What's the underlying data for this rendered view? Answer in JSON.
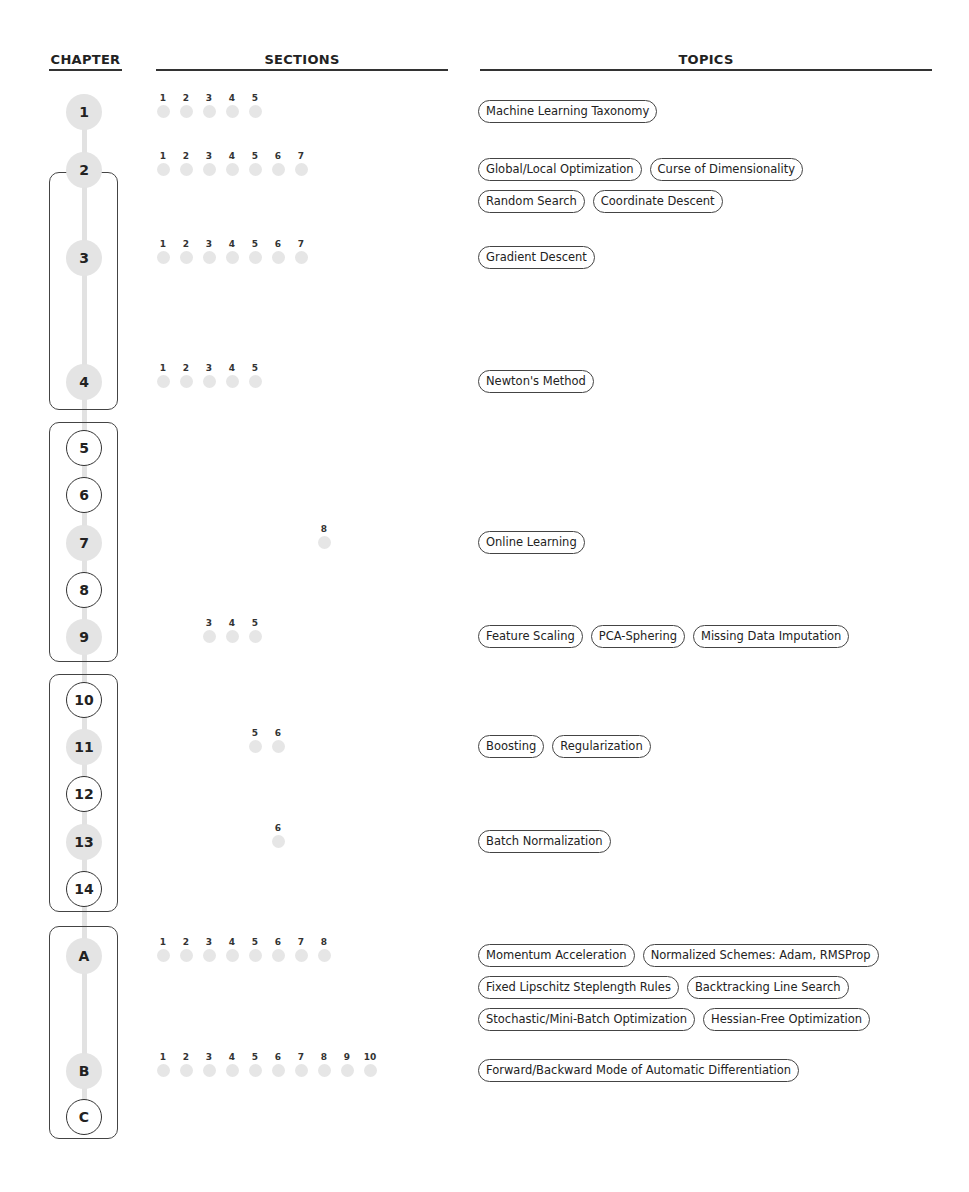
{
  "headers": {
    "chapter": "CHAPTER",
    "sections": "SECTIONS",
    "topics": "TOPICS"
  },
  "colors": {
    "filled_node": "#e4e4e4",
    "section_dot": "#e6e6e6",
    "outline": "#333333",
    "spine": "#e2e2e2"
  },
  "groups": [
    {
      "name": "group-2-4",
      "top": 172,
      "height": 238
    },
    {
      "name": "group-5-9",
      "top": 422,
      "height": 240
    },
    {
      "name": "group-10-14",
      "top": 674,
      "height": 238
    },
    {
      "name": "group-A-C",
      "top": 926,
      "height": 213
    }
  ],
  "chapters": [
    {
      "label": "1",
      "y": 112,
      "style": "filled",
      "sections": [
        1,
        2,
        3,
        4,
        5
      ],
      "topic_rows": [
        [
          "Machine Learning Taxonomy"
        ]
      ]
    },
    {
      "label": "2",
      "y": 170,
      "style": "filled",
      "sections": [
        1,
        2,
        3,
        4,
        5,
        6,
        7
      ],
      "topic_rows": [
        [
          "Global/Local Optimization",
          "Curse of Dimensionality"
        ],
        [
          "Random Search",
          "Coordinate Descent"
        ]
      ]
    },
    {
      "label": "3",
      "y": 258,
      "style": "filled",
      "sections": [
        1,
        2,
        3,
        4,
        5,
        6,
        7
      ],
      "topic_rows": [
        [
          "Gradient Descent"
        ]
      ]
    },
    {
      "label": "4",
      "y": 382,
      "style": "filled",
      "sections": [
        1,
        2,
        3,
        4,
        5
      ],
      "topic_rows": [
        [
          "Newton's Method"
        ]
      ]
    },
    {
      "label": "5",
      "y": 448,
      "style": "outline",
      "sections": [],
      "topic_rows": []
    },
    {
      "label": "6",
      "y": 495,
      "style": "outline",
      "sections": [],
      "topic_rows": []
    },
    {
      "label": "7",
      "y": 543,
      "style": "filled",
      "sections": [
        8
      ],
      "topic_rows": [
        [
          "Online Learning"
        ]
      ]
    },
    {
      "label": "8",
      "y": 590,
      "style": "outline",
      "sections": [],
      "topic_rows": []
    },
    {
      "label": "9",
      "y": 637,
      "style": "filled",
      "sections": [
        3,
        4,
        5
      ],
      "topic_rows": [
        [
          "Feature Scaling",
          "PCA-Sphering",
          "Missing Data Imputation"
        ]
      ]
    },
    {
      "label": "10",
      "y": 700,
      "style": "outline",
      "sections": [],
      "topic_rows": []
    },
    {
      "label": "11",
      "y": 747,
      "style": "filled",
      "sections": [
        5,
        6
      ],
      "topic_rows": [
        [
          "Boosting",
          "Regularization"
        ]
      ]
    },
    {
      "label": "12",
      "y": 794,
      "style": "outline",
      "sections": [],
      "topic_rows": []
    },
    {
      "label": "13",
      "y": 842,
      "style": "filled",
      "sections": [
        6
      ],
      "topic_rows": [
        [
          "Batch Normalization"
        ]
      ]
    },
    {
      "label": "14",
      "y": 889,
      "style": "outline",
      "sections": [],
      "topic_rows": []
    },
    {
      "label": "A",
      "y": 956,
      "style": "filled",
      "sections": [
        1,
        2,
        3,
        4,
        5,
        6,
        7,
        8
      ],
      "topic_rows": [
        [
          "Momentum Acceleration",
          "Normalized Schemes: Adam, RMSProp"
        ],
        [
          "Fixed Lipschitz Steplength Rules",
          "Backtracking Line Search"
        ],
        [
          "Stochastic/Mini-Batch Optimization",
          "Hessian-Free Optimization"
        ]
      ]
    },
    {
      "label": "B",
      "y": 1071,
      "style": "filled",
      "sections": [
        1,
        2,
        3,
        4,
        5,
        6,
        7,
        8,
        9,
        10
      ],
      "topic_rows": [
        [
          "Forward/Backward Mode of Automatic Differentiation"
        ]
      ]
    },
    {
      "label": "C",
      "y": 1117,
      "style": "outline",
      "sections": [],
      "topic_rows": []
    }
  ]
}
